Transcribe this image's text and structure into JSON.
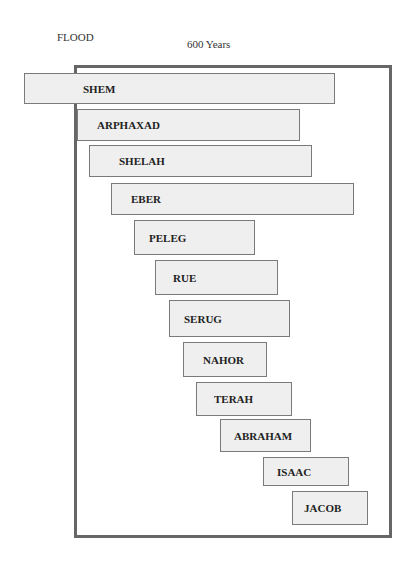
{
  "header": {
    "flood_label": "FLOOD",
    "span_label": "600 Years"
  },
  "colors": {
    "frame_border": "#666666",
    "bar_fill": "#efefef",
    "bar_border": "#7a7a7a",
    "text": "#222222"
  },
  "patriarchs": [
    {
      "name": "SHEM",
      "left": 24,
      "top": 73,
      "width": 311,
      "height": 31,
      "text_left": 58
    },
    {
      "name": "ARPHAXAD",
      "left": 77,
      "top": 109,
      "width": 223,
      "height": 32,
      "text_left": 19
    },
    {
      "name": "SHELAH",
      "left": 89,
      "top": 145,
      "width": 223,
      "height": 32,
      "text_left": 29
    },
    {
      "name": "EBER",
      "left": 111,
      "top": 183,
      "width": 243,
      "height": 32,
      "text_left": 19
    },
    {
      "name": "PELEG",
      "left": 134,
      "top": 220,
      "width": 121,
      "height": 35,
      "text_left": 14
    },
    {
      "name": "RUE",
      "left": 155,
      "top": 260,
      "width": 123,
      "height": 35,
      "text_left": 17
    },
    {
      "name": "SERUG",
      "left": 169,
      "top": 300,
      "width": 121,
      "height": 37,
      "text_left": 14
    },
    {
      "name": "NAHOR",
      "left": 183,
      "top": 342,
      "width": 84,
      "height": 35,
      "text_left": 19
    },
    {
      "name": "TERAH",
      "left": 196,
      "top": 382,
      "width": 96,
      "height": 34,
      "text_left": 17
    },
    {
      "name": "ABRAHAM",
      "left": 220,
      "top": 419,
      "width": 91,
      "height": 33,
      "text_left": 13
    },
    {
      "name": "ISAAC",
      "left": 263,
      "top": 457,
      "width": 86,
      "height": 29,
      "text_left": 13
    },
    {
      "name": "JACOB",
      "left": 292,
      "top": 491,
      "width": 76,
      "height": 34,
      "text_left": 11
    }
  ]
}
